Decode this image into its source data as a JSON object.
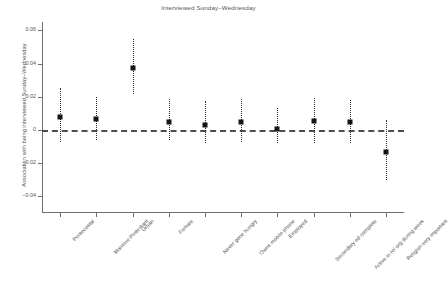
{
  "chart_data": {
    "type": "scatter",
    "title": "Interviewed Sunday–Wednesday",
    "xlabel": "",
    "ylabel": "Association with being interviewed Sunday–Wednesday",
    "ylim": [
      -0.05,
      0.065
    ],
    "yticks": [
      0.06,
      0.04,
      0.02,
      0,
      -0.02,
      -0.04
    ],
    "ytick_labels": [
      "0.06",
      "0.04",
      "0.02",
      "0",
      "−0.02",
      "−0.04"
    ],
    "grid": false,
    "legend": null,
    "reference_line": {
      "y": 0,
      "style": "dashed"
    },
    "categories": [
      "Pentecostal",
      "Mainline Protestant",
      "Urban",
      "Female",
      "Never gone hungry",
      "Owns mobile phone",
      "Employed",
      "Secondary ed complete",
      "Active in rel org during week",
      "Religion very important"
    ],
    "values": [
      0.008,
      0.0065,
      0.0375,
      0.0045,
      0.003,
      0.0045,
      0.0008,
      0.0055,
      0.0045,
      -0.013
    ],
    "ci_low": [
      -0.007,
      -0.006,
      0.0215,
      -0.006,
      -0.008,
      -0.007,
      -0.008,
      -0.008,
      -0.008,
      -0.03
    ],
    "ci_high": [
      0.025,
      0.02,
      0.055,
      0.0185,
      0.0175,
      0.0185,
      0.013,
      0.0195,
      0.018,
      0.006
    ],
    "marker": "filled-square",
    "errorbar_style": "dotted",
    "series": [
      {
        "name": "Association estimate",
        "values": [
          0.008,
          0.0065,
          0.0375,
          0.0045,
          0.003,
          0.0045,
          0.0008,
          0.0055,
          0.0045,
          -0.013
        ]
      }
    ]
  },
  "colors": {
    "marker": "#151515",
    "errorbar": "#2a2a2a",
    "axis": "#6f6f6f",
    "text": "#555555",
    "background": "#ffffff"
  }
}
